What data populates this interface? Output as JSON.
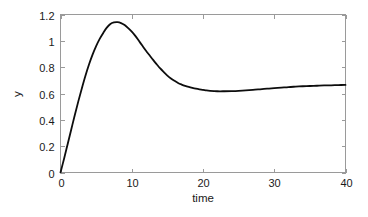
{
  "chart_data": {
    "type": "line",
    "title": "",
    "xlabel": "time",
    "ylabel": "y",
    "xlim": [
      0,
      40
    ],
    "ylim": [
      0,
      1.2
    ],
    "xticks": [
      0,
      10,
      20,
      30,
      40
    ],
    "xtick_labels": [
      "0",
      "10",
      "20",
      "30",
      "40"
    ],
    "yticks": [
      0,
      0.2,
      0.4,
      0.6,
      0.8,
      1,
      1.2
    ],
    "ytick_labels": [
      "0",
      "0.2",
      "0.4",
      "0.6",
      "0.8",
      "1",
      "1.2"
    ],
    "grid": false,
    "legend": null,
    "line_color": "#0d0d0d",
    "axis_color": "#9a9a9a",
    "background_color": "#ffffff",
    "tick_direction": "in",
    "annotations": {
      "peak_value": 1.14,
      "peak_time": 7.0,
      "trough_value": 0.615,
      "trough_time": 22.0,
      "final_value": 0.665,
      "initial_value": 0.0
    },
    "series": [
      {
        "name": "y",
        "x": [
          0,
          0.5,
          1,
          1.5,
          2,
          2.5,
          3,
          3.5,
          4,
          4.5,
          5,
          5.5,
          6,
          6.5,
          7,
          7.5,
          8,
          8.5,
          9,
          9.5,
          10,
          10.5,
          11,
          11.5,
          12,
          12.5,
          13,
          13.5,
          14,
          14.5,
          15,
          15.5,
          16,
          16.5,
          17,
          17.5,
          18,
          18.5,
          19,
          19.5,
          20,
          20.5,
          21,
          22,
          23,
          24,
          25,
          26,
          27,
          28,
          29,
          30,
          31,
          32,
          33,
          34,
          35,
          36,
          37,
          38,
          39,
          40
        ],
        "y": [
          0.0,
          0.105,
          0.215,
          0.325,
          0.435,
          0.54,
          0.64,
          0.735,
          0.82,
          0.895,
          0.96,
          1.015,
          1.06,
          1.1,
          1.128,
          1.14,
          1.142,
          1.135,
          1.12,
          1.097,
          1.07,
          1.038,
          1.0,
          0.962,
          0.925,
          0.89,
          0.855,
          0.822,
          0.79,
          0.762,
          0.736,
          0.714,
          0.696,
          0.68,
          0.668,
          0.658,
          0.65,
          0.643,
          0.637,
          0.632,
          0.628,
          0.623,
          0.62,
          0.617,
          0.617,
          0.618,
          0.62,
          0.623,
          0.627,
          0.632,
          0.637,
          0.641,
          0.645,
          0.649,
          0.652,
          0.655,
          0.657,
          0.659,
          0.661,
          0.662,
          0.664,
          0.665
        ]
      }
    ]
  }
}
